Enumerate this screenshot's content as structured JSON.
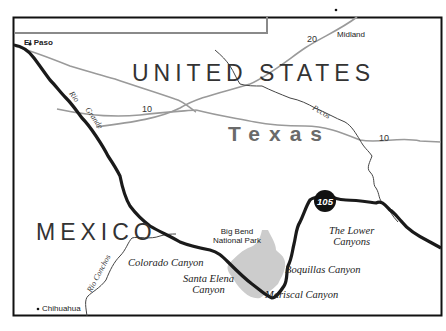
{
  "map": {
    "countries": [
      {
        "name": "UNITED STATES"
      },
      {
        "name": "MEXICO"
      }
    ],
    "state": {
      "name": "Texas"
    },
    "cities": [
      {
        "name": "El Paso"
      },
      {
        "name": "Midland"
      },
      {
        "name": "Chihuahua"
      }
    ],
    "highways": [
      {
        "label": "20"
      },
      {
        "label": "10"
      },
      {
        "label": "10"
      }
    ],
    "rivers": [
      {
        "name": "Rio Grande",
        "label_parts": [
          "Rio",
          "Grande"
        ]
      },
      {
        "name": "Pecos"
      },
      {
        "name": "Rio Conchos"
      }
    ],
    "park": {
      "line1": "Big Bend",
      "line2": "National Park",
      "fill": "#cccccc"
    },
    "canyons": [
      {
        "name": "Colorado Canyon"
      },
      {
        "line1": "Santa Elena",
        "line2": "Canyon"
      },
      {
        "name": "Mariscal Canyon"
      },
      {
        "name": "Boquillas Canyon"
      },
      {
        "line1": "The Lower",
        "line2": "Canyons"
      }
    ],
    "route_marker": {
      "label": "105"
    },
    "colors": {
      "border": "#111111",
      "rio_grande": "#1a1a1a",
      "highway": "#9a9a9a",
      "minor_river": "#444444",
      "state_label": "#6a6a6a"
    }
  }
}
